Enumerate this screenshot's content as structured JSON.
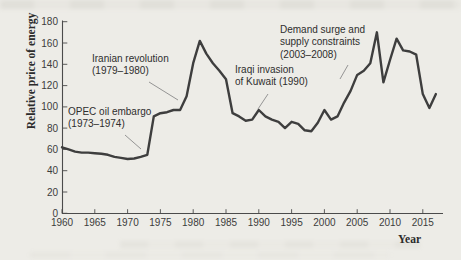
{
  "figure": {
    "y_axis_title": "Relative price of energy",
    "x_axis_title": "Year"
  },
  "annotations": [
    {
      "id": "opec",
      "lines": [
        "OPEC oil embargo",
        "(1973–1974)"
      ]
    },
    {
      "id": "iranian",
      "lines": [
        "Iranian revolution",
        "(1979–1980)"
      ]
    },
    {
      "id": "iraqi",
      "lines": [
        "Iraqi invasion",
        "of Kuwait (1990)"
      ]
    },
    {
      "id": "demand",
      "lines": [
        "Demand surge and",
        "supply constraints",
        "(2003–2008)"
      ]
    }
  ],
  "chart_data": {
    "type": "line",
    "title": "",
    "xlabel": "Year",
    "ylabel": "Relative price of energy",
    "xlim": [
      1960,
      2018
    ],
    "ylim": [
      0,
      180
    ],
    "grid": false,
    "legend": "none",
    "line_color": "#3e3e3e",
    "x_ticks": [
      1960,
      1965,
      1970,
      1975,
      1980,
      1985,
      1990,
      1995,
      2000,
      2005,
      2010,
      2015
    ],
    "y_ticks": [
      0,
      20,
      40,
      60,
      80,
      100,
      120,
      140,
      160,
      180
    ],
    "x": [
      1960,
      1961,
      1962,
      1963,
      1964,
      1965,
      1966,
      1967,
      1968,
      1969,
      1970,
      1971,
      1972,
      1973,
      1974,
      1975,
      1976,
      1977,
      1978,
      1979,
      1980,
      1981,
      1982,
      1983,
      1984,
      1985,
      1986,
      1987,
      1988,
      1989,
      1990,
      1991,
      1992,
      1993,
      1994,
      1995,
      1996,
      1997,
      1998,
      1999,
      2000,
      2001,
      2002,
      2003,
      2004,
      2005,
      2006,
      2007,
      2008,
      2009,
      2010,
      2011,
      2012,
      2013,
      2014,
      2015,
      2016,
      2017
    ],
    "values": [
      62,
      60,
      58,
      57,
      57,
      56.5,
      56,
      55,
      53,
      52,
      51,
      51.5,
      53,
      55,
      91,
      94,
      95,
      97,
      97,
      110,
      141,
      162,
      150,
      141,
      134,
      126,
      94,
      91,
      87,
      88,
      97,
      91,
      88,
      86,
      80,
      86,
      84,
      78,
      77,
      85,
      97,
      88,
      91,
      104,
      115,
      130,
      134,
      141,
      170,
      123,
      144,
      164,
      153,
      152,
      149,
      112,
      99,
      112
    ],
    "event_annotations": [
      {
        "text": "OPEC oil embargo (1973–1974)",
        "target_year": 1973,
        "target_value": 58
      },
      {
        "text": "Iranian revolution (1979–1980)",
        "target_year": 1979,
        "target_value": 106
      },
      {
        "text": "Iraqi invasion of Kuwait (1990)",
        "target_year": 1990,
        "target_value": 97
      },
      {
        "text": "Demand surge and supply constraints (2003–2008)",
        "target_year": 2003,
        "target_value": 126
      }
    ]
  }
}
